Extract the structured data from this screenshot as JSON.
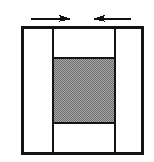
{
  "figure": {
    "name": "compression-load-diagram",
    "canvas": {
      "width": 154,
      "height": 162,
      "background": "#ffffff"
    },
    "colors": {
      "line": "#141414",
      "panel_fill": "#ffffff",
      "hatch_fill": "#9a9a9a",
      "hatch_dot": "#6e6e6e",
      "arrow": "#101010"
    },
    "outline": {
      "label": "outer-rectangle",
      "x": 21,
      "y": 26,
      "width": 123,
      "height": 129,
      "stroke_width": 2.6
    },
    "dividers": [
      {
        "label": "left-vertical-divider",
        "x": 53,
        "y1": 26,
        "y2": 155,
        "stroke_width": 2.4
      },
      {
        "label": "right-vertical-divider",
        "x": 115,
        "y1": 26,
        "y2": 155,
        "stroke_width": 2.4
      }
    ],
    "cross_lines": [
      {
        "label": "upper-horizontal-divider",
        "y": 58,
        "x1": 53,
        "x2": 115,
        "stroke_width": 2.4
      },
      {
        "label": "lower-horizontal-divider",
        "y": 123,
        "x1": 53,
        "x2": 115,
        "stroke_width": 2.4
      }
    ],
    "hatched_region": {
      "label": "stippled-core-region",
      "x": 54,
      "y": 59,
      "width": 60,
      "height": 63,
      "pattern": "fine-checker-stipple",
      "pattern_period": 2
    },
    "arrows": [
      {
        "label": "left-arrow-pointing-right",
        "direction": "right",
        "shaft_x1": 31,
        "shaft_x2": 63,
        "y": 19,
        "head_x": 72,
        "head_length": 13,
        "head_half_height": 4.2,
        "shaft_width": 1.9
      },
      {
        "label": "right-arrow-pointing-left",
        "direction": "left",
        "shaft_x1": 131,
        "shaft_x2": 101,
        "y": 19,
        "head_x": 92,
        "head_length": 13,
        "head_half_height": 4.2,
        "shaft_width": 1.9
      }
    ]
  }
}
